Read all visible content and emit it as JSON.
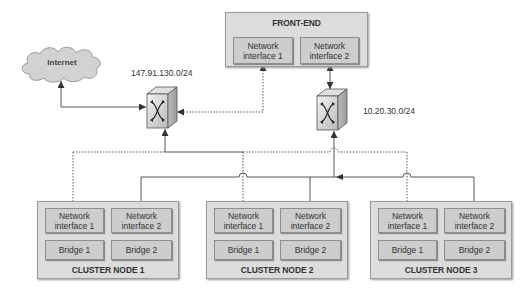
{
  "diagram": {
    "cloud": {
      "label": "Internet"
    },
    "switches": [
      {
        "label": "147.91.130.0/24"
      },
      {
        "label": "10.20.30.0/24"
      }
    ],
    "front_end": {
      "title": "FRONT-END",
      "interfaces": [
        {
          "line1": "Network",
          "line2": "interface 1"
        },
        {
          "line1": "Network",
          "line2": "interface 2"
        }
      ]
    },
    "cluster_nodes": [
      {
        "title": "CLUSTER NODE 1",
        "interfaces": [
          {
            "line1": "Network",
            "line2": "interface 1"
          },
          {
            "line1": "Network",
            "line2": "interface 2"
          }
        ],
        "bridges": [
          "Bridge 1",
          "Bridge 2"
        ]
      },
      {
        "title": "CLUSTER NODE 2",
        "interfaces": [
          {
            "line1": "Network",
            "line2": "interface 1"
          },
          {
            "line1": "Network",
            "line2": "interface 2"
          }
        ],
        "bridges": [
          "Bridge 1",
          "Bridge 2"
        ]
      },
      {
        "title": "CLUSTER NODE 3",
        "interfaces": [
          {
            "line1": "Network",
            "line2": "interface 1"
          },
          {
            "line1": "Network",
            "line2": "interface 2"
          }
        ],
        "bridges": [
          "Bridge 1",
          "Bridge 2"
        ]
      }
    ],
    "colors": {
      "box_outer": "#dcdcdc",
      "box_inner": "#cdcdcd",
      "line": "#555555",
      "cloud": "#d2d2d2"
    }
  }
}
